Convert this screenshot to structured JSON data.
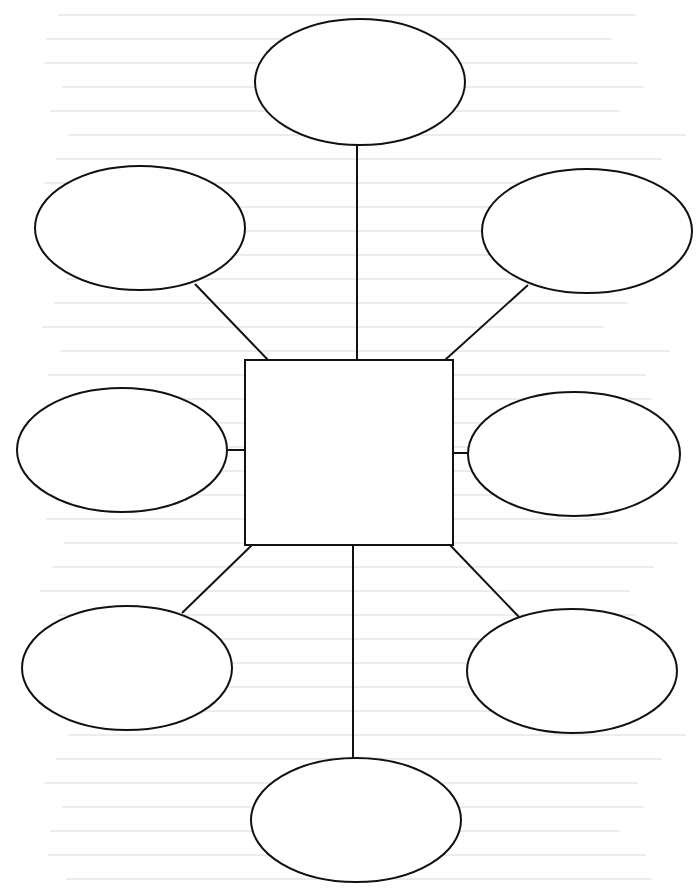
{
  "diagram": {
    "type": "web-graphic-organizer",
    "stroke_color": "#111111",
    "background": "#ffffff",
    "center": {
      "shape": "rectangle",
      "x": 245,
      "y": 360,
      "width": 208,
      "height": 185,
      "label": ""
    },
    "nodes": [
      {
        "id": "top",
        "shape": "ellipse",
        "cx": 360,
        "cy": 82,
        "rx": 105,
        "ry": 63,
        "label": ""
      },
      {
        "id": "upper-left",
        "shape": "ellipse",
        "cx": 140,
        "cy": 228,
        "rx": 105,
        "ry": 62,
        "label": ""
      },
      {
        "id": "upper-right",
        "shape": "ellipse",
        "cx": 587,
        "cy": 231,
        "rx": 105,
        "ry": 62,
        "label": ""
      },
      {
        "id": "middle-left",
        "shape": "ellipse",
        "cx": 122,
        "cy": 450,
        "rx": 105,
        "ry": 62,
        "label": ""
      },
      {
        "id": "middle-right",
        "shape": "ellipse",
        "cx": 574,
        "cy": 454,
        "rx": 106,
        "ry": 62,
        "label": ""
      },
      {
        "id": "lower-left",
        "shape": "ellipse",
        "cx": 127,
        "cy": 668,
        "rx": 105,
        "ry": 62,
        "label": ""
      },
      {
        "id": "lower-right",
        "shape": "ellipse",
        "cx": 572,
        "cy": 671,
        "rx": 105,
        "ry": 62,
        "label": ""
      },
      {
        "id": "bottom",
        "shape": "ellipse",
        "cx": 356,
        "cy": 820,
        "rx": 105,
        "ry": 62,
        "label": ""
      }
    ],
    "connectors": [
      {
        "to": "top",
        "x1": 357,
        "y1": 145,
        "x2": 357,
        "y2": 360
      },
      {
        "to": "upper-left",
        "x1": 195,
        "y1": 284,
        "x2": 268,
        "y2": 360
      },
      {
        "to": "upper-right",
        "x1": 528,
        "y1": 285,
        "x2": 445,
        "y2": 360
      },
      {
        "to": "middle-left",
        "x1": 228,
        "y1": 450,
        "x2": 245,
        "y2": 450
      },
      {
        "to": "middle-right",
        "x1": 453,
        "y1": 453,
        "x2": 468,
        "y2": 453
      },
      {
        "to": "lower-left",
        "x1": 182,
        "y1": 613,
        "x2": 252,
        "y2": 545
      },
      {
        "to": "lower-right",
        "x1": 450,
        "y1": 545,
        "x2": 519,
        "y2": 617
      },
      {
        "to": "bottom",
        "x1": 353,
        "y1": 545,
        "x2": 353,
        "y2": 758
      }
    ]
  }
}
